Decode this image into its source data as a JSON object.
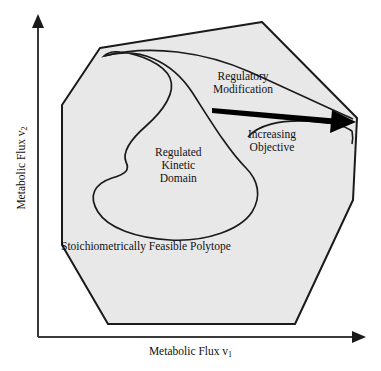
{
  "figure": {
    "title_present": false,
    "background_color": "#ffffff",
    "polytope_fill": "#e8e8e8",
    "stroke_color": "#1a1a1a",
    "arrow_color": "#000000"
  },
  "axes": {
    "x_label_text": "Metabolic Flux v",
    "x_label_subscript": "1",
    "y_label_text": "Metabolic Flux v",
    "y_label_subscript": "2",
    "origin": "38,337",
    "x_axis_end": "366,337",
    "y_axis_end": "38,14"
  },
  "labels": {
    "regulatory_modification": {
      "line1": "Regulatory",
      "line2": "Modification"
    },
    "increasing_objective": {
      "line1": "Increasing",
      "line2": "Objective"
    },
    "regulated_kinetic_domain": {
      "line1": "Regulated",
      "line2": "Kinetic",
      "line3": "Domain"
    },
    "stoichiometric_polytope": "Stoichiometrically Feasible Polytope"
  },
  "shapes": {
    "polytope_name": "stoichiometrically-feasible-polytope",
    "polytope_vertices": "100,48 262,22 357,118 353,200 295,324 108,324 62,245 62,105",
    "kinetic_domain_name": "regulated-kinetic-domain",
    "modified_domain_name": "modified-kinetic-domain",
    "arrow_name": "regulatory-modification-arrow",
    "arrow_start": "213,110",
    "arrow_end": "352,122"
  }
}
